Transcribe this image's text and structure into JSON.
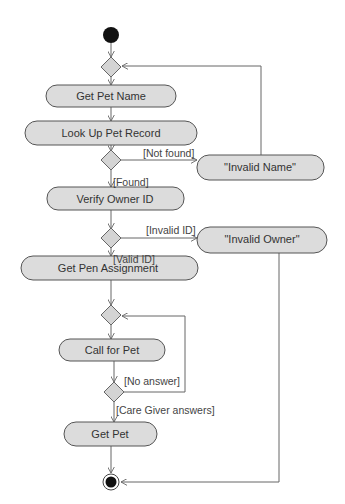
{
  "diagram": {
    "type": "UML activity diagram",
    "activities": [
      {
        "id": "get_pet_name",
        "label": "Get Pet Name"
      },
      {
        "id": "look_up_pet_record",
        "label": "Look Up Pet Record"
      },
      {
        "id": "invalid_name",
        "label": "\"Invalid Name\""
      },
      {
        "id": "verify_owner_id",
        "label": "Verify Owner ID"
      },
      {
        "id": "invalid_owner",
        "label": "\"Invalid Owner\""
      },
      {
        "id": "get_pen_assignment",
        "label": "Get Pen Assignment"
      },
      {
        "id": "call_for_pet",
        "label": "Call for Pet"
      },
      {
        "id": "get_pet",
        "label": "Get Pet"
      }
    ],
    "guards": {
      "not_found": "[Not found]",
      "found": "[Found]",
      "invalid_id": "[Invalid ID]",
      "valid_id": "[Valid ID]",
      "no_answer": "[No answer]",
      "care_giver_answers": "[Care Giver answers]"
    },
    "colors": {
      "activity_fill": "#dcdcdc",
      "stroke": "#555555",
      "node_fill": "#111111"
    }
  }
}
